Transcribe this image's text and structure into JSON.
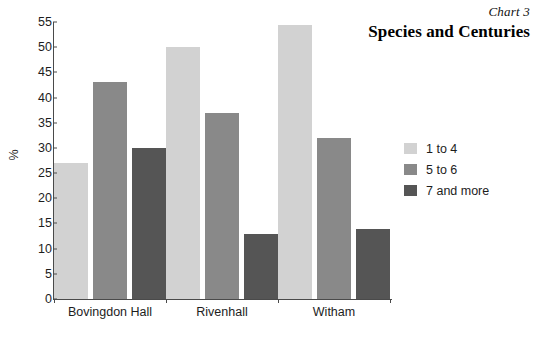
{
  "header": {
    "chart_number": "Chart 3",
    "title": "Species and Centuries"
  },
  "chart_data": {
    "type": "bar",
    "title": "Species and Centuries",
    "subtitle": "Chart 3",
    "xlabel": "",
    "ylabel": "%",
    "ylim": [
      0,
      55
    ],
    "ytick_step": 5,
    "yticks": [
      "0",
      "5",
      "10",
      "15",
      "20",
      "25",
      "30",
      "35",
      "40",
      "45",
      "50",
      "55"
    ],
    "grid": false,
    "legend_position": "right",
    "categories": [
      "Bovingdon Hall",
      "Rivenhall",
      "Witham"
    ],
    "series": [
      {
        "name": "1 to 4",
        "color": "#d2d2d2",
        "values": [
          27,
          50,
          54.5
        ]
      },
      {
        "name": "5 to 6",
        "color": "#898989",
        "values": [
          43,
          37,
          32
        ]
      },
      {
        "name": "7 and more",
        "color": "#555555",
        "values": [
          30,
          13,
          14
        ]
      }
    ]
  },
  "legend": {
    "items": [
      {
        "label": "1 to 4",
        "color": "#d2d2d2"
      },
      {
        "label": "5 to 6",
        "color": "#898989"
      },
      {
        "label": "7 and more",
        "color": "#555555"
      }
    ]
  }
}
